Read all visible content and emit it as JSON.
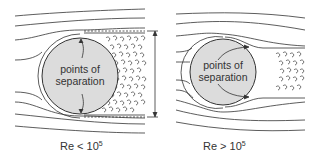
{
  "panels": [
    {
      "id": "left",
      "circle_label_line1": "points of",
      "circle_label_line2": "separation",
      "caption_base": "Re < 10",
      "caption_exp": "5",
      "wake": "wide turbulent wake with dimension arrow"
    },
    {
      "id": "right",
      "circle_label_line1": "points of",
      "circle_label_line2": "separation",
      "caption_base": "Re > 10",
      "caption_exp": "5",
      "wake": "narrow turbulent wake"
    }
  ],
  "colors": {
    "line": "#333333",
    "circle_fill": "#dcdcdc",
    "background": "#ffffff"
  }
}
